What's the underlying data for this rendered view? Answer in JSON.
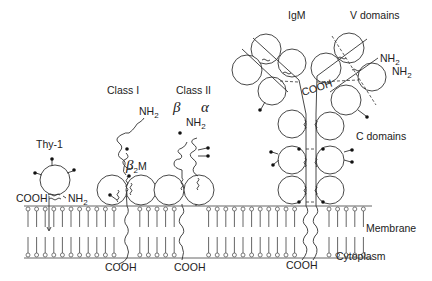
{
  "figure": {
    "type": "diagram"
  },
  "molecules": [
    {
      "id": "thy1",
      "label": "Thy-1",
      "termini": [
        "COOH",
        "NH2"
      ]
    },
    {
      "id": "class1",
      "label": "Class I",
      "subunit": "β2M",
      "termini": [
        "NH2",
        "COOH"
      ]
    },
    {
      "id": "class2",
      "label": "Class II",
      "chains": [
        "β",
        "α"
      ],
      "termini": [
        "NH2",
        "COOH"
      ]
    },
    {
      "id": "igm",
      "label": "IgM",
      "termini": [
        "NH2",
        "NH2",
        "COOH",
        "COOH"
      ]
    }
  ],
  "labels": {
    "thy1": "Thy-1",
    "thy1_cooh": "COOH",
    "thy1_nh2_base": "NH",
    "sub2": "2",
    "class1": "Class I",
    "class1_nh2_base": "NH",
    "class1_cooh": "COOH",
    "beta2m_beta": "β",
    "beta2m_m": "M",
    "class2": "Class II",
    "class2_beta": "β",
    "class2_alpha": "α",
    "class2_nh2_base": "NH",
    "class2_cooh": "COOH",
    "igm": "IgM",
    "v_domains": "V domains",
    "c_domains": "C domains",
    "igm_nh2_a": "NH",
    "igm_nh2_b": "NH",
    "igm_cooh_top": "COOH",
    "igm_cooh_bottom": "COOH",
    "membrane": "Membrane",
    "cytoplasm": "Cytoplasm"
  },
  "colors": {
    "line": "#333333",
    "background": "#ffffff"
  }
}
